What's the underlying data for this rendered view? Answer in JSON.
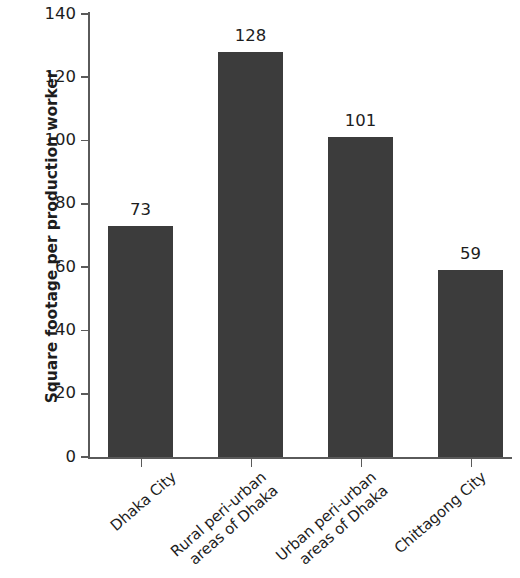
{
  "chart_data": {
    "type": "bar",
    "title": "",
    "subtitle": "",
    "xlabel": "",
    "ylabel": "Square footage per production worker",
    "categories": [
      "Dhaka City",
      "Rural peri-urban areas of Dhaka",
      "Urban peri-urban areas of Dhaka",
      "Chittagong City"
    ],
    "category_lines": [
      [
        "Dhaka City"
      ],
      [
        "Rural peri-urban",
        "areas of Dhaka"
      ],
      [
        "Urban peri-urban",
        "areas of Dhaka"
      ],
      [
        "Chittagong City"
      ]
    ],
    "values": [
      73,
      128,
      101,
      59
    ],
    "value_labels": [
      "73",
      "128",
      "101",
      "59"
    ],
    "ylim": [
      0,
      140
    ],
    "y_ticks": [
      0,
      20,
      40,
      60,
      80,
      100,
      120,
      140
    ],
    "y_tick_labels": [
      "0",
      "20",
      "40",
      "60",
      "80",
      "100",
      "120",
      "140"
    ],
    "grid": false,
    "legend": null,
    "bar_color": "#3c3c3c",
    "axis_color": "#5a5a5a",
    "text_color": "#1d1d1d"
  }
}
